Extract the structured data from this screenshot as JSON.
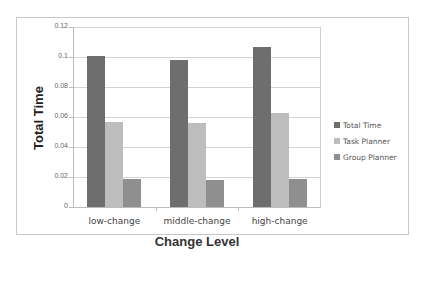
{
  "chart_data": {
    "type": "bar",
    "title": "",
    "xlabel": "Change Level",
    "ylabel": "Total Time",
    "categories": [
      "low-change",
      "middle-change",
      "high-change"
    ],
    "series": [
      {
        "name": "Total Time",
        "color": "#6e6e6e",
        "values": [
          0.101,
          0.098,
          0.107
        ]
      },
      {
        "name": "Task Planner",
        "color": "#bdbdbd",
        "values": [
          0.057,
          0.056,
          0.063
        ]
      },
      {
        "name": "Group Planner",
        "color": "#8f8f8f",
        "values": [
          0.019,
          0.018,
          0.019
        ]
      }
    ],
    "ylim": [
      0,
      0.12
    ],
    "yticks": [
      "0",
      "0.02",
      "0.04",
      "0.06",
      "0.08",
      "0.1",
      "0.12"
    ],
    "grid": true,
    "legend_position": "right"
  }
}
